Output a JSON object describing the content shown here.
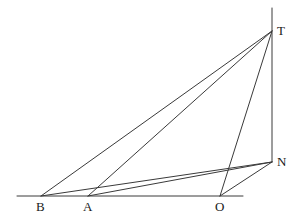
{
  "figure": {
    "type": "geometry-diagram",
    "title": "",
    "width": 300,
    "height": 223,
    "background_color": "#ffffff",
    "stroke_color": "#3a3a3a",
    "label_color": "#1a1a1a",
    "stroke_width": 1
  },
  "points": {
    "B": {
      "label": "B",
      "x": 41,
      "y": 196,
      "label_x": 36,
      "label_y": 200
    },
    "A": {
      "label": "A",
      "x": 88,
      "y": 196,
      "label_x": 83,
      "label_y": 200
    },
    "O": {
      "label": "O",
      "x": 220,
      "y": 196,
      "label_x": 215,
      "label_y": 200
    },
    "N": {
      "label": "N",
      "x": 272,
      "y": 162,
      "label_x": 277,
      "label_y": 155
    },
    "T": {
      "label": "T",
      "x": 272,
      "y": 31,
      "label_x": 277,
      "label_y": 24
    }
  },
  "segments": [
    {
      "name": "baseline",
      "x1": 17,
      "y1": 196,
      "x2": 243,
      "y2": 196
    },
    {
      "name": "vertical-TN",
      "x1": 272,
      "y1": 8,
      "x2": 272,
      "y2": 162
    },
    {
      "name": "B-to-T",
      "x1": 41,
      "y1": 196,
      "x2": 272,
      "y2": 31
    },
    {
      "name": "A-to-T",
      "x1": 88,
      "y1": 196,
      "x2": 272,
      "y2": 31
    },
    {
      "name": "O-to-T",
      "x1": 220,
      "y1": 196,
      "x2": 272,
      "y2": 31
    },
    {
      "name": "B-to-N",
      "x1": 41,
      "y1": 196,
      "x2": 272,
      "y2": 162
    },
    {
      "name": "A-to-N",
      "x1": 88,
      "y1": 196,
      "x2": 272,
      "y2": 162
    },
    {
      "name": "O-to-N",
      "x1": 220,
      "y1": 196,
      "x2": 272,
      "y2": 162
    }
  ],
  "labels_order": [
    "B",
    "A",
    "O",
    "N",
    "T"
  ]
}
